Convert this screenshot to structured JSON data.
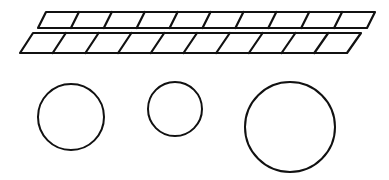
{
  "figure": {
    "background": "#ffffff",
    "line_color": "#111111",
    "strips": [
      {
        "name": "top-strip",
        "cells": 10,
        "top": {
          "y": 12,
          "x_left": 46,
          "x_right": 375
        },
        "bottom": {
          "y": 28,
          "x_left": 38,
          "x_right": 367
        }
      },
      {
        "name": "bottom-strip",
        "cells": 10,
        "top": {
          "y": 33,
          "x_left": 33,
          "x_right": 361
        },
        "bottom": {
          "y": 53,
          "x_left": 20,
          "x_right": 347
        }
      }
    ],
    "circles": [
      {
        "name": "circle-medium",
        "cx": 71,
        "cy": 117,
        "r": 33
      },
      {
        "name": "circle-small",
        "cx": 175,
        "cy": 109,
        "r": 27
      },
      {
        "name": "circle-large",
        "cx": 290,
        "cy": 127,
        "r": 45
      }
    ]
  }
}
